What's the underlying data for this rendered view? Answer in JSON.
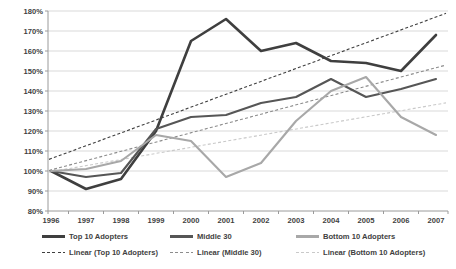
{
  "chart_data": {
    "type": "line",
    "x": [
      1996,
      1997,
      1998,
      1999,
      2000,
      2001,
      2002,
      2003,
      2004,
      2005,
      2006,
      2007
    ],
    "xtick_labels": [
      "1996",
      "1997",
      "1998",
      "1999",
      "2000",
      "2001",
      "2002",
      "2003",
      "2004",
      "2005",
      "2006",
      "2007"
    ],
    "ylim": [
      80,
      180
    ],
    "ytick_step": 10,
    "ytick_labels": [
      "80%",
      "90%",
      "100%",
      "110%",
      "120%",
      "130%",
      "140%",
      "150%",
      "160%",
      "170%",
      "180%"
    ],
    "grid": true,
    "legend_position": "bottom",
    "series": [
      {
        "name": "Top 10 Adopters",
        "color": "#3f3f3f",
        "stroke_width": 2.6,
        "values": [
          100,
          91,
          96,
          120,
          165,
          176,
          160,
          164,
          155,
          154,
          150,
          168
        ]
      },
      {
        "name": "Middle 30",
        "color": "#565656",
        "stroke_width": 2.1,
        "values": [
          100,
          97,
          99,
          121,
          127,
          128,
          134,
          137,
          146,
          137,
          141,
          146
        ]
      },
      {
        "name": "Bottom 10 Adopters",
        "color": "#a8a8a8",
        "stroke_width": 2.1,
        "values": [
          100,
          101,
          105,
          118,
          115,
          97,
          104,
          125,
          140,
          147,
          127,
          118
        ]
      }
    ],
    "trendlines": [
      {
        "name": "Linear (Top 10 Adopters)",
        "style": "linear-fit-dashed",
        "color": "#3f3f3f",
        "source_series": 0
      },
      {
        "name": "Linear (Middle 30)",
        "style": "linear-fit-dashed",
        "color": "#8c8c8c",
        "source_series": 1
      },
      {
        "name": "Linear (Bottom 10 Adopters)",
        "style": "linear-fit-dashed",
        "color": "#c9c9c9",
        "source_series": 2
      }
    ],
    "colors": {
      "grid": "#d9d9d9",
      "axis": "#9a9a9a",
      "tick_text": "#3f3f3f",
      "background": "#ffffff"
    }
  },
  "legend": {
    "row1": [
      {
        "label": "Top 10 Adopters"
      },
      {
        "label": "Middle 30"
      },
      {
        "label": "Bottom 10 Adopters"
      }
    ],
    "row2": [
      {
        "label": "Linear (Top 10 Adopters)"
      },
      {
        "label": "Linear (Middle 30)"
      },
      {
        "label": "Linear (Bottom 10 Adopters)"
      }
    ]
  }
}
